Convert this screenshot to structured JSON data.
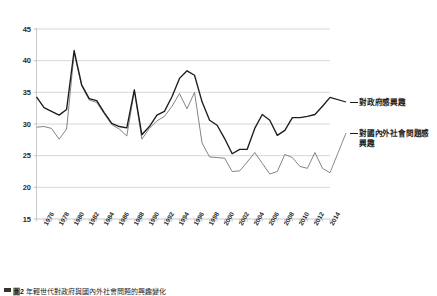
{
  "figure": {
    "caption_prefix": "圖",
    "caption_number": "2",
    "caption_text": "年輕世代對政府與國內外社會問題的興趣變化"
  },
  "legend": {
    "position": "right",
    "entries": [
      {
        "label": "對政府感興趣",
        "color": "#1c1c1c",
        "dash": "—"
      },
      {
        "label": "對國內外社會問題感興趣",
        "color": "#7d7d7d",
        "dash": "—"
      }
    ]
  },
  "axes": {
    "y_ticks": [
      "15",
      "20",
      "25",
      "30",
      "35",
      "40",
      "45"
    ],
    "y_min": 15,
    "y_max": 45,
    "grid": true,
    "x_ticks": [
      "1976",
      "1978",
      "1980",
      "1982",
      "1984",
      "1986",
      "1988",
      "1990",
      "1992",
      "1994",
      "1996",
      "1998",
      "2000",
      "2002",
      "2004",
      "2006",
      "2008",
      "2010",
      "2012",
      "2014"
    ]
  },
  "chart_data": {
    "type": "line",
    "title": "",
    "subtitle": "",
    "xlabel": "",
    "ylabel": "",
    "ylim": [
      15,
      45
    ],
    "grid": true,
    "legend_position": "right",
    "x": [
      1975,
      1976,
      1977,
      1978,
      1979,
      1980,
      1981,
      1982,
      1983,
      1984,
      1985,
      1986,
      1987,
      1988,
      1989,
      1990,
      1991,
      1992,
      1993,
      1994,
      1995,
      1996,
      1997,
      1998,
      1999,
      2000,
      2001,
      2002,
      2003,
      2004,
      2005,
      2006,
      2007,
      2008,
      2009,
      2010,
      2011,
      2012,
      2013,
      2014
    ],
    "tick_labels": [
      "1976",
      "1978",
      "1980",
      "1982",
      "1984",
      "1986",
      "1988",
      "1990",
      "1992",
      "1994",
      "1996",
      "1998",
      "2000",
      "2002",
      "2004",
      "2006",
      "2008",
      "2010",
      "2012",
      "2014"
    ],
    "series": [
      {
        "name": "對政府感興趣",
        "color": "#1c1c1c",
        "values": [
          34.3,
          32.6,
          32.0,
          31.4,
          32.3,
          41.6,
          36.2,
          34.0,
          33.7,
          31.8,
          30.1,
          29.6,
          29.4,
          35.4,
          28.3,
          29.6,
          31.4,
          32.0,
          34.3,
          37.2,
          38.4,
          37.7,
          33.5,
          30.6,
          29.8,
          27.7,
          25.3,
          26.0,
          26.0,
          29.3,
          31.5,
          30.6,
          28.2,
          29.0,
          31.0,
          31.0,
          31.2,
          31.5,
          32.8,
          34.2
        ]
      },
      {
        "name": "對國內外社會問題感興趣",
        "color": "#7d7d7d",
        "values": [
          29.5,
          29.6,
          29.3,
          27.6,
          29.2,
          41.2,
          36.0,
          33.8,
          33.4,
          31.6,
          29.9,
          29.2,
          28.1,
          35.2,
          27.6,
          29.3,
          30.5,
          31.2,
          32.8,
          34.8,
          32.4,
          35.0,
          27.0,
          24.8,
          24.7,
          24.6,
          22.5,
          22.6,
          24.0,
          25.5,
          23.8,
          22.1,
          22.5,
          25.2,
          24.7,
          23.3,
          23.0,
          25.5,
          23.0,
          22.3
        ]
      }
    ]
  }
}
